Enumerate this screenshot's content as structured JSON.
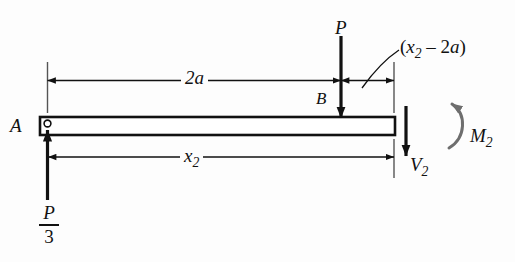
{
  "figure": {
    "type": "engineering-free-body-diagram",
    "colors": {
      "line": "#111111",
      "beam_fill": "#ffffff",
      "moment_arc": "#6e6e6e",
      "background": "#fdfdfd"
    },
    "beam": {
      "support_label": "A",
      "load_point_label": "B"
    },
    "labels": {
      "point_a": "A",
      "point_b": "B",
      "applied_load": "P",
      "dimension_left": "2a",
      "dimension_total": "x",
      "dimension_total_sub": "2",
      "dimension_right_open": "(",
      "dimension_right_x": "x",
      "dimension_right_sub": "2",
      "dimension_right_minus": " – 2",
      "dimension_right_a": "a",
      "dimension_right_close": ")",
      "shear_force": "V",
      "shear_force_sub": "2",
      "moment": "M",
      "moment_sub": "2",
      "reaction_numerator": "P",
      "reaction_denominator": "3"
    },
    "annotations": {
      "reaction_full": "P/3",
      "right_dimension_full": "(x2 - 2a)",
      "shear_full": "V2",
      "moment_full": "M2"
    }
  }
}
